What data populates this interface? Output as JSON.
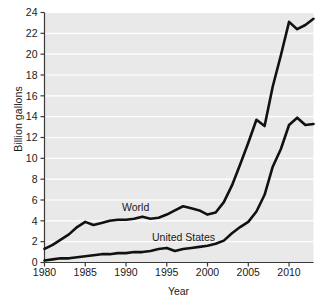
{
  "chart_data": {
    "type": "line",
    "title": "",
    "xlabel": "Year",
    "ylabel": "Billion gallons",
    "xlim": [
      1980,
      2013
    ],
    "ylim": [
      0,
      24
    ],
    "xticks": [
      1980,
      1985,
      1990,
      1995,
      2000,
      2005,
      2010
    ],
    "yticks": [
      0,
      2,
      4,
      6,
      8,
      10,
      12,
      14,
      16,
      18,
      20,
      22,
      24
    ],
    "grid": "horizontal-white",
    "legend": "inline-annotations",
    "x": [
      1980,
      1981,
      1982,
      1983,
      1984,
      1985,
      1986,
      1987,
      1988,
      1989,
      1990,
      1991,
      1992,
      1993,
      1994,
      1995,
      1996,
      1997,
      1998,
      1999,
      2000,
      2001,
      2002,
      2003,
      2004,
      2005,
      2006,
      2007,
      2008,
      2009,
      2010,
      2011,
      2012,
      2013
    ],
    "series": [
      {
        "name": "World",
        "color": "#111111",
        "values": [
          1.3,
          1.7,
          2.2,
          2.7,
          3.4,
          3.9,
          3.6,
          3.8,
          4.0,
          4.1,
          4.1,
          4.2,
          4.4,
          4.2,
          4.3,
          4.6,
          5.0,
          5.4,
          5.2,
          5.0,
          4.6,
          4.8,
          5.8,
          7.4,
          9.4,
          11.5,
          13.7,
          13.1,
          16.9,
          19.9,
          23.1,
          22.4,
          22.8,
          23.4
        ]
      },
      {
        "name": "United States",
        "color": "#111111",
        "values": [
          0.2,
          0.3,
          0.4,
          0.4,
          0.5,
          0.6,
          0.7,
          0.8,
          0.8,
          0.9,
          0.9,
          1.0,
          1.0,
          1.1,
          1.3,
          1.4,
          1.1,
          1.3,
          1.4,
          1.5,
          1.6,
          1.8,
          2.1,
          2.8,
          3.4,
          3.9,
          4.9,
          6.5,
          9.2,
          10.9,
          13.2,
          13.9,
          13.2,
          13.3
        ]
      }
    ],
    "annotations": [
      {
        "label": "World",
        "x_px": 122,
        "y_px": 202
      },
      {
        "label": "United States",
        "x_px": 152,
        "y_px": 232
      }
    ]
  },
  "colors": {
    "plot_background": "#e9e9e9",
    "gridline": "#ffffff",
    "axis": "#3a3a3a",
    "line": "#111111",
    "text": "#1a1a1a",
    "page_background": "#ffffff"
  }
}
